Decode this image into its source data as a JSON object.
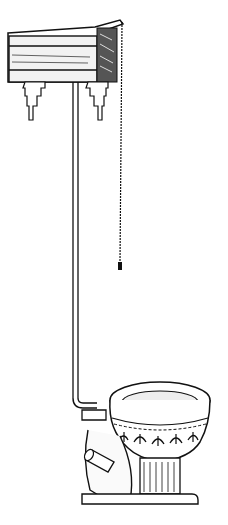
{
  "illustration": {
    "subject": "High-tank pull-chain toilet (engraving)",
    "parts": [
      "cistern-tank",
      "wall-brackets",
      "flush-pipe",
      "pull-chain",
      "chain-handle",
      "toilet-bowl",
      "bowl-rim",
      "decorative-frieze",
      "pedestal-base",
      "outlet-spigot"
    ],
    "colors": {
      "ink": "#111111",
      "paper": "#ffffff"
    }
  }
}
